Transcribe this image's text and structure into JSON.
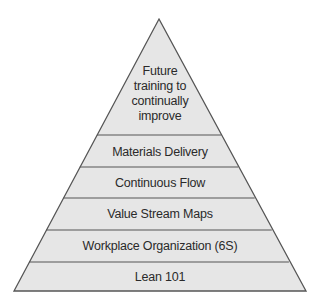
{
  "diagram": {
    "type": "pyramid",
    "fill_color": "#e6e6e6",
    "line_color": "#555555",
    "top": {
      "lines": [
        "Future",
        "training to",
        "continually",
        "improve"
      ]
    },
    "levels": [
      {
        "label": "Materials Delivery"
      },
      {
        "label": "Continuous Flow"
      },
      {
        "label": "Value Stream Maps"
      },
      {
        "label": "Workplace Organization (6S)"
      },
      {
        "label": "Lean 101"
      }
    ]
  }
}
